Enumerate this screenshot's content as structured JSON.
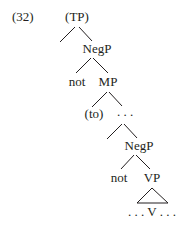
{
  "example_number": "(32)",
  "tree": {
    "root": "(TP)",
    "level1": {
      "node": "NegP",
      "left": "not",
      "right": "MP"
    },
    "level2": {
      "left": "(to)",
      "right": ". . ."
    },
    "level3": {
      "node": "NegP",
      "left": "not",
      "right": "VP"
    },
    "terminal": ". . . V . . ."
  },
  "colors": {
    "ink": "#231f20",
    "background": "#ffffff"
  }
}
